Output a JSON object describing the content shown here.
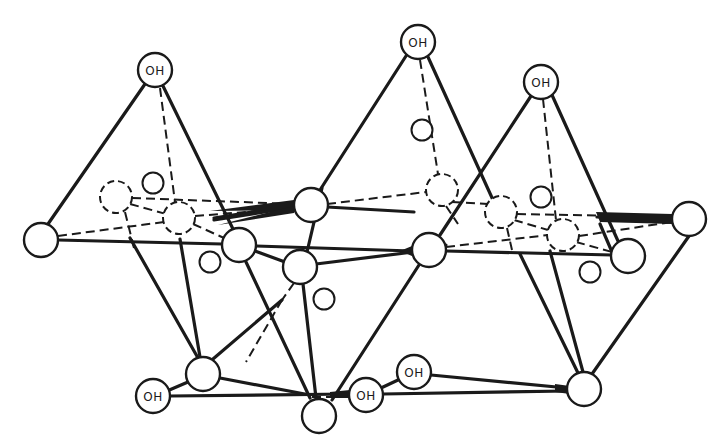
{
  "figure": {
    "labels": {
      "oh_top_left": "OH",
      "oh_top_middle": "OH",
      "oh_top_right": "OH",
      "oh_bottom_left": "OH",
      "oh_bottom_middle": "OH",
      "oh_bottom_right": "OH"
    },
    "colors": {
      "line": "#1a1a1a",
      "background": "#ffffff"
    }
  }
}
